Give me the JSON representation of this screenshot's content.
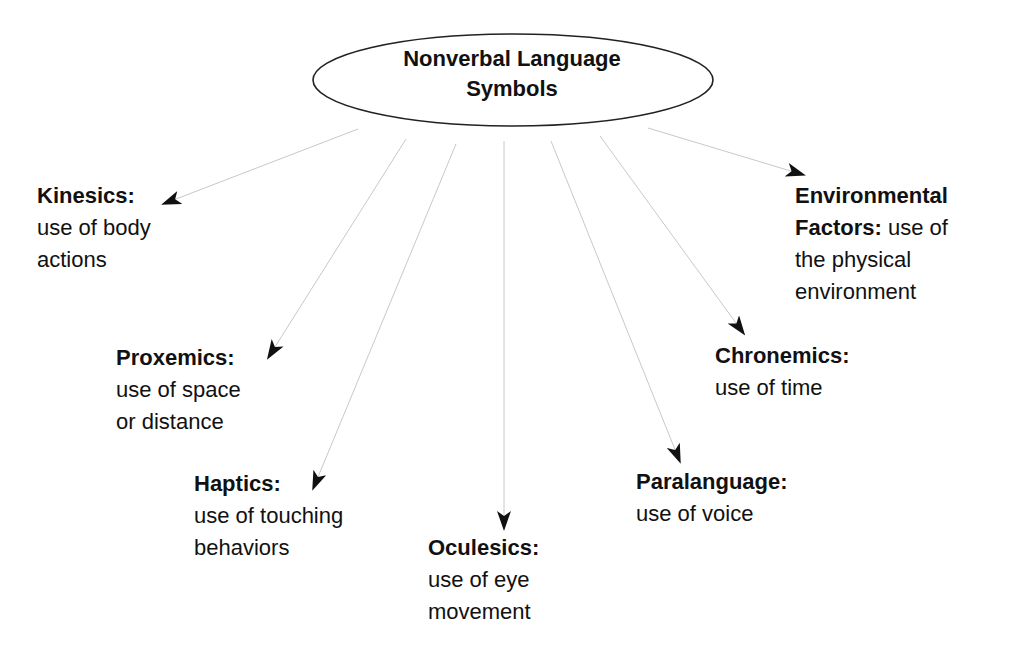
{
  "diagram": {
    "type": "concept-map",
    "root": {
      "title_line1": "Nonverbal Language",
      "title_line2": "Symbols"
    },
    "nodes": [
      {
        "id": "kinesics",
        "term": "Kinesics:",
        "desc_line1": "use of body",
        "desc_line2": "actions"
      },
      {
        "id": "proxemics",
        "term": "Proxemics:",
        "desc_line1": "use of space",
        "desc_line2": "or distance"
      },
      {
        "id": "haptics",
        "term": "Haptics:",
        "desc_line1": "use of touching",
        "desc_line2": "behaviors"
      },
      {
        "id": "oculesics",
        "term": "Oculesics:",
        "desc_line1": "use of eye",
        "desc_line2": "movement"
      },
      {
        "id": "paralanguage",
        "term": "Paralanguage:",
        "desc_line1": "use of voice"
      },
      {
        "id": "chronemics",
        "term": "Chronemics:",
        "desc_line1": "use of time"
      },
      {
        "id": "environmental",
        "term_line1": "Environmental",
        "term_line2": "Factors:",
        "desc_inline": " use of",
        "desc_line1": "the physical",
        "desc_line2": "environment"
      }
    ],
    "colors": {
      "text": "#111111",
      "ellipse_stroke": "#222222",
      "connector": "#c8c8c8",
      "arrowhead": "#111111",
      "background": "#ffffff"
    }
  }
}
